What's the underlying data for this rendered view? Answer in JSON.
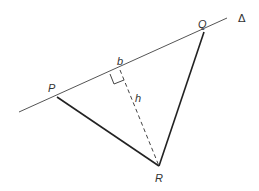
{
  "diagram": {
    "title": "",
    "line_label": "Δ",
    "vertices": {
      "P": {
        "label": "P"
      },
      "Q": {
        "label": "Q"
      },
      "R": {
        "label": "R"
      }
    },
    "base_label": "b",
    "height_label": "h",
    "colors": {
      "line": "#555555",
      "triangle": "#222222",
      "text": "#333333"
    }
  }
}
